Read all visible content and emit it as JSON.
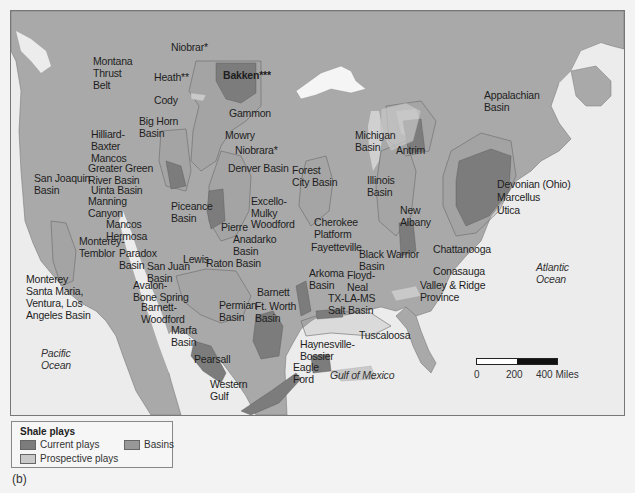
{
  "colors": {
    "water": "#ececec",
    "land": "#a9a9a9",
    "basin": "#989898",
    "current_play": "#7c7c7c",
    "prospective_play": "#c9c9c9",
    "outline": "#6a6a6a"
  },
  "labels": {
    "niobrar_north": "Niobrar*",
    "montana_thrust_belt": "Montana\nThrust\nBelt",
    "heath": "Heath**",
    "bakken": "Bakken***",
    "cody": "Cody",
    "gammon": "Gammon",
    "big_horn_basin": "Big Horn\nBasin",
    "mowry": "Mowry",
    "hilliard_baxter_mancos": "Hilliard-\nBaxter\nMancos",
    "niobrara": "Niobrara*",
    "greater_green_river": "Greater Green\nRiver Basin",
    "denver_basin": "Denver Basin",
    "uinta_basin": "Uinta Basin",
    "san_joaquin_basin": "San Joaquin\nBasin",
    "manning_canyon": "Manning\nCanyon",
    "piceance_basin": "Piceance\nBasin",
    "mancos": "Mancos",
    "hermosa": "Hermosa",
    "monterey_temblor": "Monterey-\nTemblor",
    "paradox_basin": "Paradox\nBasin",
    "san_juan_basin": "San Juan\nBasin",
    "lewis": "Lewis",
    "pierre": "Pierre",
    "anadarko_basin": "Anadarko\nBasin",
    "raton_basin": "Raton Basin",
    "forest_city_basin": "Forest\nCity Basin",
    "excello_mulky": "Excello-\nMulky",
    "woodford": "Woodford",
    "cherokee_platform": "Cherokee\nPlatform",
    "fayetteville": "Fayetteville",
    "arkoma_basin": "Arkoma\nBasin",
    "monterey_santa_maria": "Monterey\nSanta Maria,\nVentura, Los\nAngeles Basin",
    "avalon_bone_spring": "Avalon-\nBone Spring",
    "barnett_woodford": "Barnett-\nWoodford",
    "marfa_basin": "Marfa\nBasin",
    "permian_basin": "Permian\nBasin",
    "barnett": "Barnett",
    "ft_worth_basin": "Ft. Worth\nBasin",
    "pearsall": "Pearsall",
    "eagle_ford": "Eagle\nFord",
    "western_gulf": "Western\nGulf",
    "haynesville_bossier": "Haynesville-\nBossier",
    "tx_la_ms_salt_basin": "TX-LA-MS\nSalt Basin",
    "floyd_neal": "Floyd-\nNeal",
    "black_warrior_basin": "Black Warrior\nBasin",
    "tuscaloosa": "Tuscaloosa",
    "michigan_basin": "Michigan\nBasin",
    "antrim": "Antrim",
    "illinois_basin": "Illinois\nBasin",
    "new_albany": "New\nAlbany",
    "appalachian_basin": "Appalachian\nBasin",
    "devonian_ohio": "Devonian (Ohio)",
    "marcellus": "Marcellus",
    "utica": "Utica",
    "chattanooga": "Chattanooga",
    "conasauga": "Conasauga",
    "valley_ridge": "Valley & Ridge\nProvince",
    "pacific_ocean": "Pacific\nOcean",
    "atlantic_ocean": "Atlantic\nOcean",
    "gulf_of_mexico": "Gulf of Mexico"
  },
  "scale": {
    "ticks": [
      "0",
      "200",
      "400 Miles"
    ]
  },
  "legend": {
    "title": "Shale plays",
    "items": [
      {
        "label": "Current plays",
        "color": "#7c7c7c"
      },
      {
        "label": "Prospective plays",
        "color": "#c9c9c9"
      },
      {
        "label": "Basins",
        "color": "#989898"
      }
    ]
  },
  "caption": "(b)"
}
